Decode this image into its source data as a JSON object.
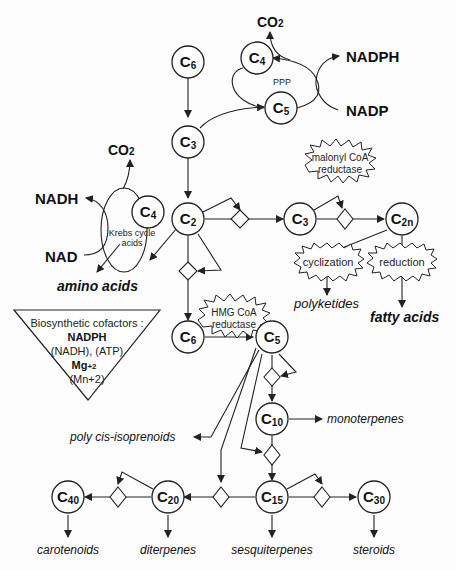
{
  "diagram": {
    "nodes": {
      "c6_top": {
        "label": "C",
        "sub": "6"
      },
      "c4_ppp": {
        "label": "C",
        "sub": "4"
      },
      "c5_ppp": {
        "label": "C",
        "sub": "5"
      },
      "c3_main": {
        "label": "C",
        "sub": "3"
      },
      "c4_krebs": {
        "label": "C",
        "sub": "4"
      },
      "c2": {
        "label": "C",
        "sub": "2"
      },
      "c3_right": {
        "label": "C",
        "sub": "3"
      },
      "c2n": {
        "label": "C",
        "sub": "2n"
      },
      "c6_mid": {
        "label": "C",
        "sub": "6"
      },
      "c5_mid": {
        "label": "C",
        "sub": "5"
      },
      "c10": {
        "label": "C",
        "sub": "10"
      },
      "c15": {
        "label": "C",
        "sub": "15"
      },
      "c20": {
        "label": "C",
        "sub": "20"
      },
      "c30": {
        "label": "C",
        "sub": "30"
      },
      "c40": {
        "label": "C",
        "sub": "40"
      }
    },
    "labels": {
      "co2_top": "CO",
      "co2_top_sub": "2",
      "nadph": "NADPH",
      "nadp": "NADP",
      "ppp": "PPP",
      "co2_left": "CO",
      "co2_left_sub": "2",
      "nadh": "NADH",
      "nad": "NAD",
      "krebs_line1": "Krebs cycle",
      "krebs_line2": "acids",
      "amino_acids": "amino acids",
      "malonyl_line1": "malonyl CoA",
      "malonyl_line2": "reductase",
      "cyclization": "cyclization",
      "reduction": "reduction",
      "polyketides": "polyketides",
      "fatty_acids": "fatty acids",
      "hmg_line1": "HMG CoA",
      "hmg_line2": "reductase",
      "monoterpenes": "monoterpenes",
      "poly_cis": "poly cis-isoprenoids",
      "carotenoids": "carotenoids",
      "diterpenes": "diterpenes",
      "sesquiterpenes": "sesquiterpenes",
      "steroids": "steroids"
    },
    "cofactors": {
      "heading": "Biosynthetic cofactors :",
      "line1": "NADPH",
      "line2": "(NADH), (ATP)",
      "line3_main": "Mg",
      "line3_sup": "+2",
      "line4": "(Mn+2)"
    }
  }
}
